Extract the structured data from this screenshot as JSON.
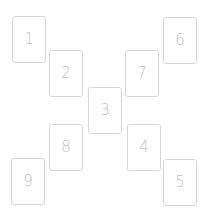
{
  "board": {
    "cards": [
      {
        "label": "1",
        "x": 12,
        "y": 16
      },
      {
        "label": "2",
        "x": 49,
        "y": 50
      },
      {
        "label": "3",
        "x": 88,
        "y": 87
      },
      {
        "label": "4",
        "x": 127,
        "y": 124
      },
      {
        "label": "5",
        "x": 163,
        "y": 159
      },
      {
        "label": "6",
        "x": 163,
        "y": 17
      },
      {
        "label": "7",
        "x": 125,
        "y": 50
      },
      {
        "label": "8",
        "x": 49,
        "y": 124
      },
      {
        "label": "9",
        "x": 11,
        "y": 158
      }
    ],
    "colors": {
      "border": "#d6d6d6",
      "label": "#bdbdbd",
      "background": "#ffffff"
    }
  }
}
